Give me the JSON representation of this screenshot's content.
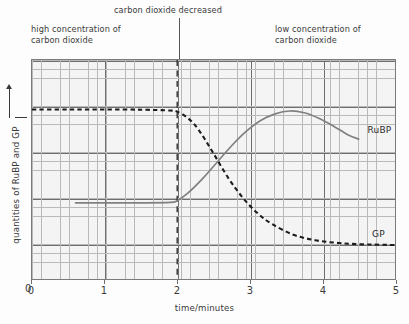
{
  "annotations": {
    "high_co2": "high concentration of\ncarbon dioxide",
    "event": "carbon dioxide decreased",
    "low_co2": "low concentration of\ncarbon dioxide"
  },
  "axes": {
    "x_title": "time/minutes",
    "y_title": "quantities of RuBP and GP",
    "y_origin_label": "0",
    "x_tick_labels": [
      "0",
      "1",
      "2",
      "3",
      "4",
      "5"
    ]
  },
  "series_labels": {
    "rubp": "RuBP",
    "gp": "GP"
  },
  "colors": {
    "gp_stroke": "#1d1d1d",
    "rubp_stroke": "#808080",
    "grid_major": "#6e6e6e",
    "grid_minor": "#b9b9b9",
    "plot_background": "#f4f4f4",
    "event_line": "#2f2f2f"
  },
  "chart_data": {
    "type": "line",
    "title": "",
    "xlabel": "time/minutes",
    "ylabel": "quantities of RuBP and GP",
    "xlim": [
      0,
      5
    ],
    "ylim": [
      0,
      1
    ],
    "grid": true,
    "legend": "inline-right-of-curve",
    "x_ticks": [
      0,
      1,
      2,
      3,
      4,
      5
    ],
    "y_ticks_labeled": [
      "0"
    ],
    "event_marker": {
      "label": "carbon dioxide decreased",
      "x": 2,
      "style": "dashed-vertical"
    },
    "regions": [
      {
        "label": "high concentration of carbon dioxide",
        "x_range": [
          0,
          2
        ]
      },
      {
        "label": "low concentration of carbon dioxide",
        "x_range": [
          2,
          5
        ]
      }
    ],
    "series": [
      {
        "name": "GP",
        "style": "dashed",
        "color": "#1d1d1d",
        "x": [
          0.0,
          0.5,
          1.0,
          1.5,
          1.9,
          2.0,
          2.15,
          2.3,
          2.5,
          2.7,
          2.9,
          3.1,
          3.3,
          3.6,
          3.9,
          4.2,
          4.5,
          5.0
        ],
        "y": [
          0.775,
          0.775,
          0.775,
          0.774,
          0.77,
          0.765,
          0.735,
          0.68,
          0.575,
          0.465,
          0.375,
          0.305,
          0.255,
          0.205,
          0.18,
          0.168,
          0.162,
          0.158
        ]
      },
      {
        "name": "RuBP",
        "style": "solid",
        "color": "#808080",
        "x": [
          0.6,
          1.0,
          1.5,
          1.9,
          2.0,
          2.15,
          2.35,
          2.55,
          2.75,
          2.95,
          3.15,
          3.35,
          3.55,
          3.75,
          3.95,
          4.15,
          4.35,
          4.5
        ],
        "y": [
          0.35,
          0.35,
          0.35,
          0.352,
          0.36,
          0.395,
          0.46,
          0.535,
          0.61,
          0.675,
          0.725,
          0.755,
          0.768,
          0.76,
          0.735,
          0.7,
          0.66,
          0.64
        ]
      }
    ]
  }
}
